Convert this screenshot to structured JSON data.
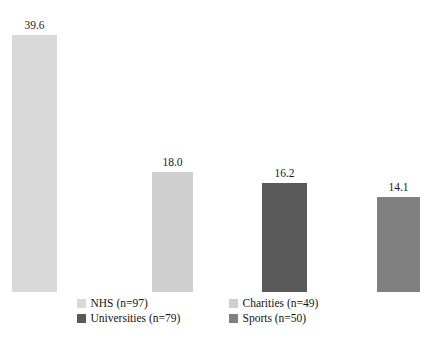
{
  "chart_data": {
    "type": "bar",
    "title": "",
    "subtitle": "",
    "xlabel": "",
    "ylabel": "",
    "ylim": [
      0,
      44
    ],
    "grid": false,
    "legend_position": "bottom",
    "categories": [
      "NHS (n=97)",
      "Charities (n=49)",
      "Universities (n=79)",
      "Sports (n=50)"
    ],
    "values": [
      39.6,
      18.0,
      16.2,
      14.1
    ],
    "value_labels": [
      "39.6",
      "18.0",
      "16.2",
      "14.1"
    ],
    "colors": [
      "#d9d9d9",
      "#cfcfcf",
      "#595959",
      "#808080"
    ],
    "series": [
      {
        "name": "Percentage",
        "values": [
          39.6,
          18.0,
          16.2,
          14.1
        ]
      }
    ]
  },
  "bars": [
    {
      "name": "NHS (n=97)",
      "value_label": "39.6",
      "color": "#d9d9d9",
      "left_px": 12,
      "width_px": 45,
      "height_px": 257
    },
    {
      "name": "Charities (n=49)",
      "value_label": "18.0",
      "color": "#cfcfcf",
      "left_px": 152,
      "width_px": 41,
      "height_px": 120
    },
    {
      "name": "Universities (n=79)",
      "value_label": "16.2",
      "color": "#595959",
      "left_px": 262,
      "width_px": 45,
      "height_px": 109
    },
    {
      "name": "Sports (n=50)",
      "value_label": "14.1",
      "color": "#808080",
      "left_px": 377,
      "width_px": 43,
      "height_px": 95
    }
  ],
  "legend": {
    "rows": [
      [
        {
          "label": "NHS (n=97)",
          "color": "#d9d9d9"
        },
        {
          "label": "Charities (n=49)",
          "color": "#cfcfcf"
        }
      ],
      [
        {
          "label": "Universities (n=79)",
          "color": "#595959"
        },
        {
          "label": "Sports (n=50)",
          "color": "#808080"
        }
      ]
    ]
  }
}
